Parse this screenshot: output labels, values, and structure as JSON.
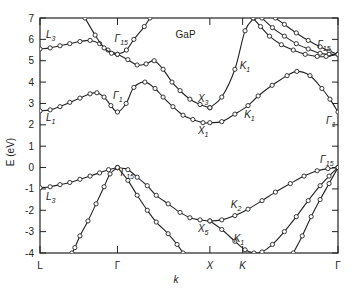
{
  "chart_data": {
    "type": "line",
    "title": "GaP",
    "xlabel": "k",
    "ylabel": "E (eV)",
    "ylim": [
      -4,
      7
    ],
    "yticks": [
      7,
      6,
      5,
      4,
      3,
      2,
      1,
      0,
      -1,
      -2,
      -3,
      -4
    ],
    "grid": false,
    "xticks": [
      {
        "label": "L",
        "x": 0.0
      },
      {
        "label": "Γ",
        "x": 0.26
      },
      {
        "label": "X",
        "x": 0.57
      },
      {
        "label": "K",
        "x": 0.68
      },
      {
        "label": "Γ",
        "x": 1.0
      }
    ],
    "series": [
      {
        "name": "conduction L3-Γ15-X3",
        "points": [
          [
            0,
            5.55
          ],
          [
            0.034,
            5.6
          ],
          [
            0.067,
            5.7
          ],
          [
            0.1,
            5.8
          ],
          [
            0.134,
            5.9
          ],
          [
            0.168,
            5.95
          ],
          [
            0.2,
            5.8
          ],
          [
            0.228,
            5.5
          ],
          [
            0.26,
            5.3
          ],
          [
            0.295,
            5.05
          ],
          [
            0.326,
            4.8
          ],
          [
            0.356,
            4.85
          ],
          [
            0.383,
            5.0
          ],
          [
            0.413,
            4.6
          ],
          [
            0.443,
            4.0
          ],
          [
            0.47,
            3.6
          ],
          [
            0.503,
            3.2
          ],
          [
            0.537,
            2.95
          ],
          [
            0.57,
            2.8
          ]
        ]
      },
      {
        "name": "Γ15 upper parabola",
        "points": [
          [
            0.151,
            7
          ],
          [
            0.185,
            6.2
          ],
          [
            0.215,
            5.6
          ],
          [
            0.24,
            5.35
          ],
          [
            0.26,
            5.3
          ],
          [
            0.29,
            5.5
          ],
          [
            0.315,
            6.0
          ],
          [
            0.35,
            6.6
          ],
          [
            0.369,
            7
          ]
        ]
      },
      {
        "name": "conduction L1-Γ1-X1-K1-Γ1",
        "points": [
          [
            0,
            2.65
          ],
          [
            0.034,
            2.7
          ],
          [
            0.067,
            2.85
          ],
          [
            0.1,
            3.05
          ],
          [
            0.134,
            3.25
          ],
          [
            0.168,
            3.45
          ],
          [
            0.191,
            3.5
          ],
          [
            0.215,
            3.3
          ],
          [
            0.238,
            2.9
          ],
          [
            0.26,
            2.6
          ],
          [
            0.289,
            3.0
          ],
          [
            0.315,
            3.75
          ],
          [
            0.352,
            4.0
          ],
          [
            0.386,
            3.7
          ],
          [
            0.413,
            3.3
          ],
          [
            0.446,
            2.85
          ],
          [
            0.48,
            2.45
          ],
          [
            0.513,
            2.25
          ],
          [
            0.547,
            2.1
          ],
          [
            0.57,
            2.1
          ],
          [
            0.61,
            2.15
          ],
          [
            0.654,
            2.5
          ],
          [
            0.698,
            2.9
          ],
          [
            0.732,
            3.35
          ],
          [
            0.779,
            3.85
          ],
          [
            0.829,
            4.3
          ],
          [
            0.862,
            4.5
          ],
          [
            0.906,
            4.3
          ],
          [
            0.946,
            3.7
          ],
          [
            0.973,
            3.2
          ],
          [
            1.0,
            2.6
          ]
        ]
      },
      {
        "name": "X3-K1 rising",
        "points": [
          [
            0.57,
            2.8
          ],
          [
            0.61,
            3.3
          ],
          [
            0.654,
            4.6
          ],
          [
            0.688,
            6.4
          ],
          [
            0.718,
            7
          ]
        ]
      },
      {
        "name": "upper Γ15 a",
        "points": [
          [
            0.79,
            7
          ],
          [
            0.82,
            6.7
          ],
          [
            0.86,
            6.3
          ],
          [
            0.9,
            5.95
          ],
          [
            0.94,
            5.65
          ],
          [
            0.97,
            5.45
          ],
          [
            1.0,
            5.3
          ]
        ]
      },
      {
        "name": "upper Γ15 b",
        "points": [
          [
            0.745,
            7
          ],
          [
            0.78,
            6.55
          ],
          [
            0.82,
            6.15
          ],
          [
            0.86,
            5.8
          ],
          [
            0.9,
            5.55
          ],
          [
            0.94,
            5.35
          ],
          [
            0.97,
            5.3
          ],
          [
            1.0,
            5.3
          ]
        ]
      },
      {
        "name": "upper Γ15 c",
        "points": [
          [
            0.715,
            7
          ],
          [
            0.74,
            6.6
          ],
          [
            0.77,
            6.15
          ],
          [
            0.81,
            5.75
          ],
          [
            0.85,
            5.5
          ],
          [
            0.89,
            5.3
          ],
          [
            0.93,
            5.2
          ],
          [
            0.96,
            5.2
          ],
          [
            1.0,
            5.3
          ]
        ]
      },
      {
        "name": "valence L3-Γ15",
        "points": [
          [
            0,
            -0.95
          ],
          [
            0.034,
            -0.9
          ],
          [
            0.067,
            -0.8
          ],
          [
            0.1,
            -0.7
          ],
          [
            0.134,
            -0.55
          ],
          [
            0.168,
            -0.4
          ],
          [
            0.2,
            -0.25
          ],
          [
            0.23,
            -0.1
          ],
          [
            0.26,
            0
          ]
        ]
      },
      {
        "name": "valence Γ15-X5-K2-Γ15",
        "points": [
          [
            0.26,
            0
          ],
          [
            0.295,
            -0.1
          ],
          [
            0.326,
            -0.45
          ],
          [
            0.36,
            -0.85
          ],
          [
            0.39,
            -1.3
          ],
          [
            0.43,
            -1.7
          ],
          [
            0.47,
            -2.1
          ],
          [
            0.503,
            -2.35
          ],
          [
            0.537,
            -2.45
          ],
          [
            0.57,
            -2.5
          ],
          [
            0.61,
            -2.45
          ],
          [
            0.654,
            -2.25
          ],
          [
            0.698,
            -1.95
          ],
          [
            0.745,
            -1.55
          ],
          [
            0.79,
            -1.15
          ],
          [
            0.84,
            -0.75
          ],
          [
            0.886,
            -0.4
          ],
          [
            0.93,
            -0.15
          ],
          [
            0.966,
            -0.05
          ],
          [
            1.0,
            0
          ]
        ]
      },
      {
        "name": "valence Γ-X heavy",
        "points": [
          [
            0.26,
            0
          ],
          [
            0.295,
            -0.6
          ],
          [
            0.326,
            -1.3
          ],
          [
            0.36,
            -2.0
          ],
          [
            0.39,
            -2.55
          ],
          [
            0.43,
            -3.1
          ],
          [
            0.46,
            -3.6
          ],
          [
            0.48,
            -4
          ]
        ]
      },
      {
        "name": "valence Γ-L split-off",
        "points": [
          [
            0.26,
            0
          ],
          [
            0.235,
            -0.3
          ],
          [
            0.215,
            -0.9
          ],
          [
            0.188,
            -1.7
          ],
          [
            0.161,
            -2.5
          ],
          [
            0.134,
            -3.2
          ],
          [
            0.117,
            -3.75
          ],
          [
            0.107,
            -4
          ]
        ]
      },
      {
        "name": "valence X5-K1-Γ",
        "points": [
          [
            0.57,
            -2.5
          ],
          [
            0.61,
            -2.9
          ],
          [
            0.654,
            -3.45
          ],
          [
            0.688,
            -3.85
          ],
          [
            0.718,
            -4
          ],
          [
            0.745,
            -3.95
          ],
          [
            0.78,
            -3.6
          ],
          [
            0.82,
            -3.0
          ],
          [
            0.86,
            -2.3
          ],
          [
            0.9,
            -1.55
          ],
          [
            0.94,
            -0.85
          ],
          [
            0.97,
            -0.4
          ],
          [
            1.0,
            0
          ]
        ]
      },
      {
        "name": "valence K-Γ steep",
        "points": [
          [
            0.85,
            -4
          ],
          [
            0.88,
            -3.2
          ],
          [
            0.91,
            -2.3
          ],
          [
            0.94,
            -1.5
          ],
          [
            0.97,
            -0.75
          ],
          [
            1.0,
            0
          ]
        ]
      }
    ],
    "annotations": [
      {
        "text": "L",
        "sub": "3",
        "x": 0.02,
        "E": 6.05
      },
      {
        "text": "Γ",
        "sub": "15",
        "x": 0.25,
        "E": 5.9
      },
      {
        "text": "GaP",
        "sub": "",
        "x": 0.455,
        "E": 6.05
      },
      {
        "text": "K",
        "sub": "1",
        "x": 0.67,
        "E": 4.6
      },
      {
        "text": "Γ",
        "sub": "15",
        "x": 0.93,
        "E": 5.6
      },
      {
        "text": "Γ",
        "sub": "1",
        "x": 0.245,
        "E": 3.2
      },
      {
        "text": "L",
        "sub": "1",
        "x": 0.02,
        "E": 2.2
      },
      {
        "text": "X",
        "sub": "3",
        "x": 0.53,
        "E": 3.05
      },
      {
        "text": "X",
        "sub": "1",
        "x": 0.53,
        "E": 1.55
      },
      {
        "text": "K",
        "sub": "1",
        "x": 0.685,
        "E": 2.3
      },
      {
        "text": "Γ",
        "sub": "1",
        "x": 0.96,
        "E": 2.05
      },
      {
        "text": "Γ",
        "sub": "15",
        "x": 0.94,
        "E": 0.2
      },
      {
        "text": "Γ",
        "sub": "15",
        "x": 0.27,
        "E": -0.4
      },
      {
        "text": "L",
        "sub": "3",
        "x": 0.02,
        "E": -1.5
      },
      {
        "text": "K",
        "sub": "2",
        "x": 0.64,
        "E": -1.9
      },
      {
        "text": "X",
        "sub": "5",
        "x": 0.53,
        "E": -3.0
      },
      {
        "text": "K",
        "sub": "1",
        "x": 0.65,
        "E": -3.5
      }
    ]
  },
  "axes": {
    "y_label": "E (eV)",
    "x_label": "k",
    "panel_title": "GaP"
  }
}
